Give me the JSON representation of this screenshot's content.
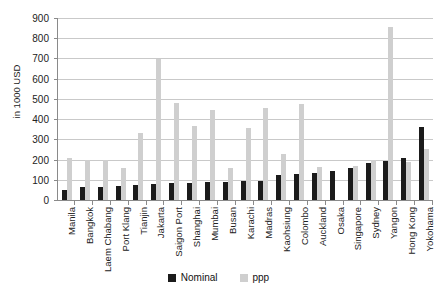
{
  "chart_data": {
    "type": "bar",
    "title": "",
    "xlabel": "",
    "ylabel": "in 1000 USD",
    "ylim": [
      0,
      900
    ],
    "ytick_step": 100,
    "yticks": [
      900,
      800,
      700,
      600,
      500,
      400,
      300,
      200,
      100,
      0
    ],
    "grid": true,
    "legend_position": "bottom-center",
    "categories": [
      "Manila",
      "Bangkok",
      "Laem Chabang",
      "Port Klang",
      "Tianjin",
      "Jakarta",
      "Saigon Port",
      "Shanghai",
      "Mumbai",
      "Busan",
      "Karachi",
      "Madras",
      "Kaohsiung",
      "Colombo",
      "Auckland",
      "Osaka",
      "Singapore",
      "Sydney",
      "Yangon",
      "Hong Kong",
      "Yokohama"
    ],
    "series": [
      {
        "name": "Nominal",
        "color": "#1b1b1b",
        "values": [
          50,
          62,
          63,
          68,
          74,
          78,
          82,
          84,
          90,
          91,
          92,
          94,
          124,
          131,
          132,
          144,
          158,
          183,
          191,
          206,
          361
        ]
      },
      {
        "name": "ppp",
        "color": "#cfcfcf",
        "values": [
          209,
          199,
          200,
          159,
          329,
          699,
          480,
          364,
          447,
          160,
          356,
          455,
          226,
          477,
          161,
          0,
          170,
          199,
          858,
          188,
          253
        ]
      }
    ]
  },
  "legend": {
    "items": [
      {
        "label": "Nominal"
      },
      {
        "label": "ppp"
      }
    ]
  }
}
